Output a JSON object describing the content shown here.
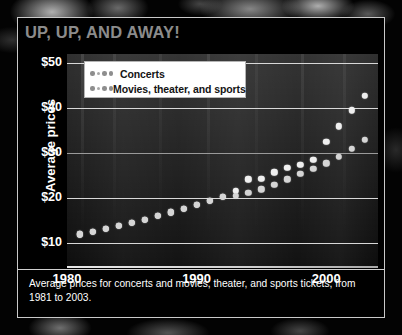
{
  "title": "UP, UP, AND AWAY!",
  "caption": "Average prices for concerts and movies, theater, and sports tickets, from 1981 to 2003.",
  "legend": {
    "items": [
      {
        "label": "Concerts",
        "color": "#efefef"
      },
      {
        "label": "Movies, theater, and sports",
        "color": "#d5d5d5"
      }
    ]
  },
  "axes": {
    "ylabel": "Average prices",
    "yticks": [
      "$10",
      "$20",
      "$30",
      "$40",
      "$50"
    ],
    "xticks": [
      "1980",
      "1990",
      "2000"
    ]
  },
  "chart_data": {
    "type": "scatter",
    "title": "UP, UP, AND AWAY!",
    "xlabel": "",
    "ylabel": "Average prices",
    "xlim": [
      1980,
      2004
    ],
    "ylim": [
      5,
      52
    ],
    "yticks": [
      10,
      20,
      30,
      40,
      50
    ],
    "ytick_labels": [
      "$10",
      "$20",
      "$30",
      "$40",
      "$50"
    ],
    "xticks": [
      1980,
      1990,
      2000
    ],
    "xtick_labels": [
      "1980",
      "1990",
      "2000"
    ],
    "grid": "horizontal",
    "legend_position": "top-left",
    "x": [
      1981,
      1982,
      1983,
      1984,
      1985,
      1986,
      1987,
      1988,
      1989,
      1990,
      1991,
      1992,
      1993,
      1994,
      1995,
      1996,
      1997,
      1998,
      1999,
      2000,
      2001,
      2002,
      2003
    ],
    "series": [
      {
        "name": "Concerts",
        "color": "#efefef",
        "values": [
          12.0,
          12.6,
          13.2,
          13.9,
          14.6,
          15.3,
          16.1,
          16.9,
          17.7,
          18.5,
          19.4,
          20.3,
          21.6,
          24.2,
          24.4,
          25.8,
          26.8,
          27.5,
          28.5,
          32.5,
          36.0,
          39.5,
          42.8
        ]
      },
      {
        "name": "Movies, theater, and sports",
        "color": "#d5d5d5",
        "values": [
          12.0,
          12.6,
          13.2,
          13.9,
          14.6,
          15.3,
          16.1,
          16.9,
          17.7,
          18.5,
          19.4,
          20.3,
          20.6,
          21.2,
          22.0,
          23.0,
          24.2,
          25.4,
          26.6,
          27.8,
          29.2,
          31.0,
          33.0
        ]
      }
    ]
  }
}
